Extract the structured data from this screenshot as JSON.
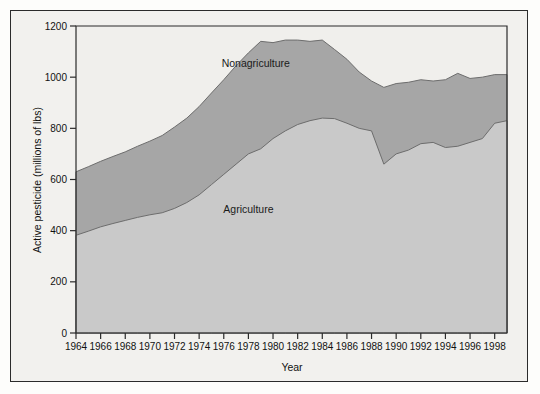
{
  "chart_data": {
    "type": "area",
    "stacked": true,
    "title": "",
    "xlabel": "Year",
    "ylabel": "Active pesticide (millions of lbs)",
    "xlim": [
      1964,
      1999
    ],
    "ylim": [
      0,
      1200
    ],
    "yticks": [
      0,
      200,
      400,
      600,
      800,
      1000,
      1200
    ],
    "xticks": [
      1964,
      1966,
      1968,
      1970,
      1972,
      1974,
      1976,
      1978,
      1980,
      1982,
      1984,
      1986,
      1988,
      1990,
      1992,
      1994,
      1996,
      1998
    ],
    "xtick_labels": [
      "1964",
      "1966",
      "1968",
      "1970",
      "1972",
      "1974",
      "1976",
      "1978",
      "1980",
      "1982",
      "1984",
      "1986",
      "1988",
      "1990",
      "1992",
      "1994",
      "1996",
      "1998"
    ],
    "ytick_labels": [
      "0",
      "200",
      "400",
      "600",
      "800",
      "1000",
      "1200"
    ],
    "grid": false,
    "legend_position": "inline-annotation",
    "x": [
      1964,
      1965,
      1966,
      1967,
      1968,
      1969,
      1970,
      1971,
      1972,
      1973,
      1974,
      1975,
      1976,
      1977,
      1978,
      1979,
      1980,
      1981,
      1982,
      1983,
      1984,
      1985,
      1986,
      1987,
      1988,
      1989,
      1990,
      1991,
      1992,
      1993,
      1994,
      1995,
      1996,
      1997,
      1998,
      1999
    ],
    "series": [
      {
        "name": "Agriculture",
        "color": "#c9c9c9",
        "values": [
          382,
          398,
          415,
          428,
          440,
          452,
          462,
          470,
          487,
          510,
          540,
          580,
          620,
          660,
          700,
          720,
          760,
          790,
          815,
          830,
          840,
          838,
          820,
          800,
          790,
          660,
          700,
          715,
          740,
          745,
          725,
          730,
          745,
          760,
          820,
          830
        ]
      },
      {
        "name": "Nonagriculture",
        "color": "#a6a6a6",
        "values": [
          248,
          252,
          256,
          262,
          268,
          278,
          288,
          302,
          318,
          330,
          345,
          358,
          370,
          385,
          395,
          420,
          375,
          355,
          330,
          310,
          305,
          270,
          250,
          220,
          195,
          300,
          275,
          265,
          250,
          240,
          265,
          285,
          250,
          240,
          190,
          180
        ]
      }
    ],
    "totals": [
      630,
      650,
      671,
      690,
      708,
      730,
      750,
      772,
      805,
      840,
      885,
      938,
      990,
      1045,
      1095,
      1140,
      1135,
      1145,
      1145,
      1140,
      1145,
      1108,
      1070,
      1020,
      985,
      960,
      975,
      980,
      990,
      985,
      990,
      1015,
      995,
      1000,
      1010,
      1010
    ],
    "annotations": [
      {
        "name": "Nonagriculture",
        "x": 1978.6,
        "y": 1040
      },
      {
        "name": "Agriculture",
        "x": 1978.0,
        "y": 470
      }
    ]
  },
  "axes": {
    "ylabel": "Active pesticide (millions of lbs)",
    "xlabel": "Year"
  },
  "colors": {
    "agriculture": "#c9c9c9",
    "nonagriculture": "#a6a6a6",
    "plot_background": "#f0efec",
    "frame": "#2b2b2b",
    "page_background": "#f2f1ee"
  }
}
